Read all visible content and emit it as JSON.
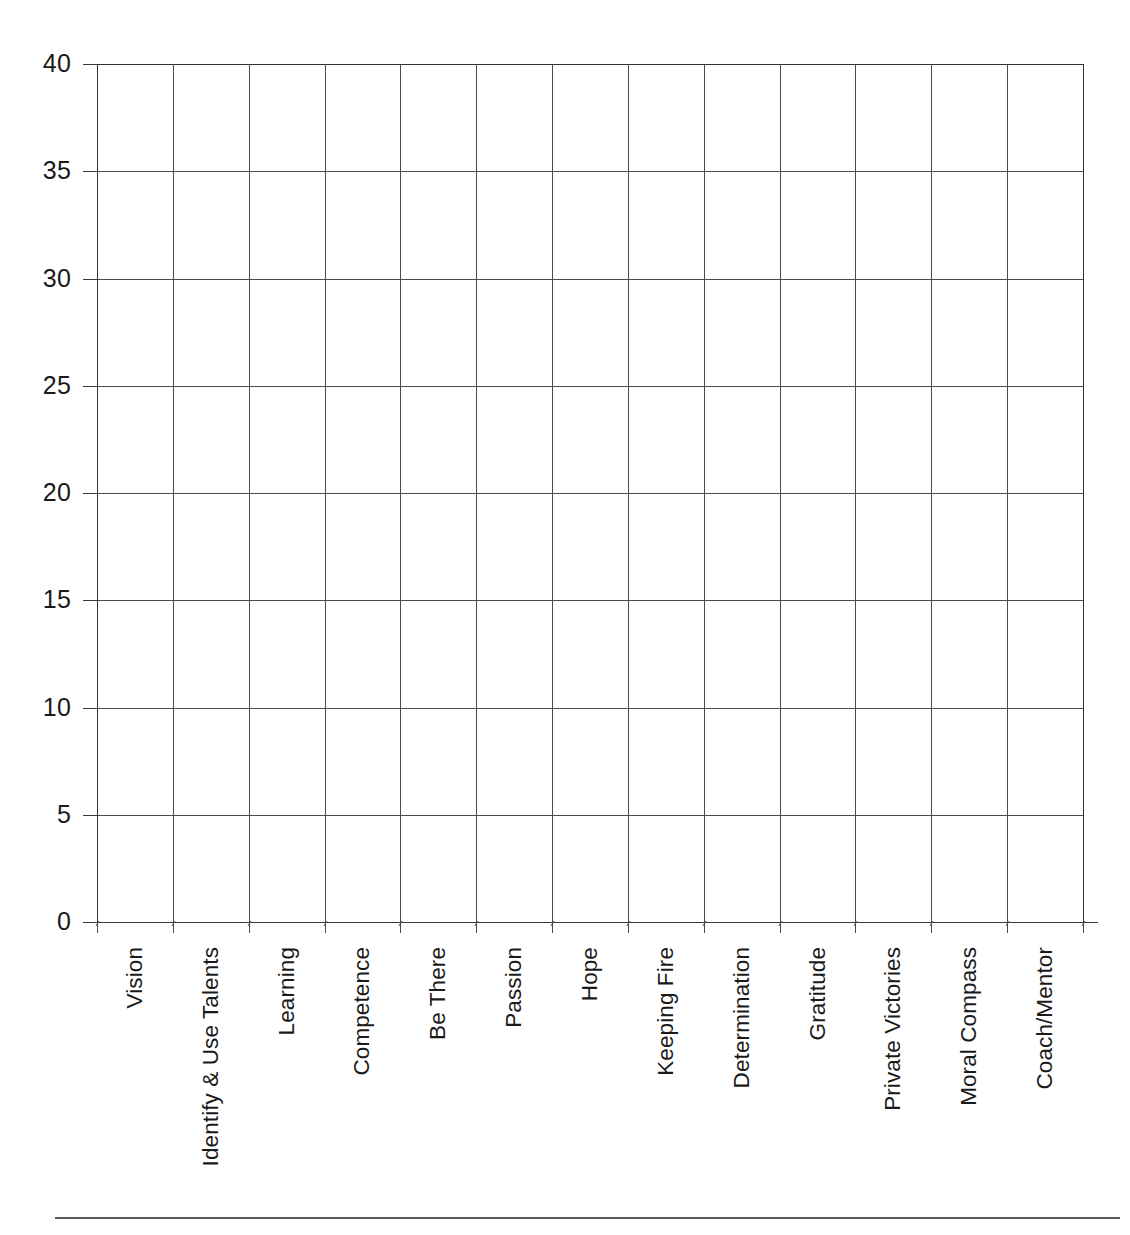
{
  "chart_data": {
    "type": "bar",
    "title": "",
    "subtitle": "",
    "xlabel": "",
    "ylabel": "",
    "categories": [
      "Vision",
      "Identify & Use Talents",
      "Learning",
      "Competence",
      "Be There",
      "Passion",
      "Hope",
      "Keeping Fire",
      "Determination",
      "Gratitude",
      "Private Victories",
      "Moral Compass",
      "Coach/Mentor"
    ],
    "values": [
      0,
      0,
      0,
      0,
      0,
      0,
      0,
      0,
      0,
      0,
      0,
      0,
      0
    ],
    "ylim": [
      0,
      40
    ],
    "ytick_labels": [
      "0",
      "5",
      "10",
      "15",
      "20",
      "25",
      "30",
      "35",
      "40"
    ],
    "ytick_values": [
      0,
      5,
      10,
      15,
      20,
      25,
      30,
      35,
      40
    ],
    "grid": true,
    "legend": "none",
    "axis_color": "#3a3a3a",
    "grid_color": "#4a4a4a",
    "background_color": "#ffffff"
  },
  "figure": {
    "bottom_rule_color": "#5a5a5a"
  }
}
